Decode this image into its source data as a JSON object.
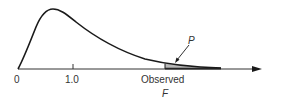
{
  "diagram": {
    "type": "f-distribution-tail",
    "axis": {
      "ticks": [
        {
          "label": "0",
          "value": 0
        },
        {
          "label": "1.0",
          "value": 1.0
        }
      ],
      "observed_label": "Observed",
      "observed_symbol": "F"
    },
    "annotation": {
      "label": "P",
      "description": "shaded upper-tail area beyond observed F"
    },
    "colors": {
      "curve": "#1a1a1a",
      "axis": "#333333",
      "shade": "#b8b8b8"
    }
  }
}
